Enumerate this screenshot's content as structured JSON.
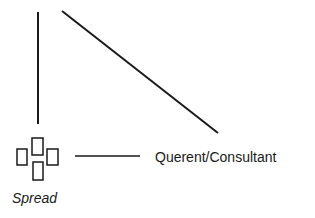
{
  "diagram": {
    "nodes": [
      {
        "id": "spread",
        "label": "Spread",
        "icon": "card-spread-icon"
      },
      {
        "id": "querent",
        "label": "Querent/Consultant"
      }
    ],
    "edges": [
      {
        "from": "spread",
        "to": "top-left",
        "kind": "vertical-line"
      },
      {
        "from": "top",
        "to": "querent",
        "kind": "diagonal-line"
      },
      {
        "from": "spread",
        "to": "querent",
        "kind": "horizontal-line"
      }
    ],
    "colors": {
      "line": "#1a1a1a",
      "background": "#ffffff"
    }
  }
}
